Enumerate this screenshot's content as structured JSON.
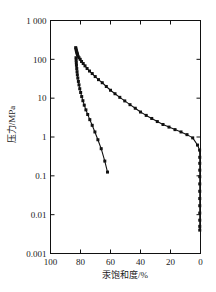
{
  "chart_data": {
    "type": "line",
    "title": "",
    "xlabel": "汞饱和度/%",
    "ylabel": "压力/MPa",
    "xlim": [
      100,
      0
    ],
    "ylim": [
      0.001,
      1000
    ],
    "x_reversed": true,
    "y_scale": "log",
    "grid": false,
    "legend": "none",
    "xticks": [
      "100",
      "80",
      "60",
      "40",
      "20",
      "0"
    ],
    "xtick_values": [
      100,
      80,
      60,
      40,
      20,
      0
    ],
    "yticks": [
      "1 000",
      "100",
      "10",
      "1",
      "0.1",
      "0.01",
      "0.001"
    ],
    "ytick_values": [
      1000,
      100,
      10,
      1,
      0.1,
      0.01,
      0.001
    ],
    "marker": "filled-square",
    "line_color": "#111111",
    "series": [
      {
        "name": "intrusion-extrusion-upper",
        "x": [
          83.2,
          83.0,
          82.8,
          82.6,
          82.4,
          82.2,
          82.0,
          81.6,
          81.0,
          80.2,
          79.3,
          78.2,
          77.0,
          75.6,
          74.0,
          72.2,
          70.2,
          68.0,
          65.5,
          62.8,
          60.0,
          57.0,
          53.8,
          50.5,
          47.0,
          43.5,
          40.0,
          36.2,
          32.5,
          28.8,
          25.0,
          21.0,
          17.0,
          13.0,
          9.0,
          5.2,
          2.0,
          0.6,
          0.5,
          0.5,
          0.5,
          0.5,
          0.5,
          0.5,
          0.5,
          0.5,
          0.5,
          0.5,
          0.5,
          0.5
        ],
        "y": [
          200,
          185,
          170,
          158,
          148,
          140,
          132,
          120,
          110,
          100,
          88,
          78,
          68,
          58,
          50,
          43,
          36,
          30,
          25,
          20,
          16,
          13,
          10.5,
          8.5,
          6.8,
          5.5,
          4.4,
          3.6,
          3.0,
          2.5,
          2.1,
          1.8,
          1.55,
          1.35,
          1.15,
          0.95,
          0.62,
          0.46,
          0.3,
          0.21,
          0.14,
          0.095,
          0.062,
          0.04,
          0.026,
          0.017,
          0.011,
          0.0072,
          0.005,
          0.004
        ]
      },
      {
        "name": "intrusion-lower",
        "x": [
          83.0,
          82.9,
          82.8,
          82.7,
          82.5,
          82.3,
          82.1,
          81.8,
          81.4,
          81.0,
          80.5,
          79.9,
          79.2,
          78.4,
          77.5,
          76.4,
          75.2,
          73.8,
          72.2,
          70.4,
          68.4,
          66.2,
          63.8,
          62.0
        ],
        "y": [
          110,
          95,
          82,
          70,
          58,
          48,
          40,
          33,
          27,
          22,
          17.5,
          14,
          11,
          8.6,
          6.6,
          5.0,
          3.8,
          2.8,
          2.0,
          1.35,
          0.85,
          0.5,
          0.24,
          0.125
        ]
      }
    ]
  }
}
